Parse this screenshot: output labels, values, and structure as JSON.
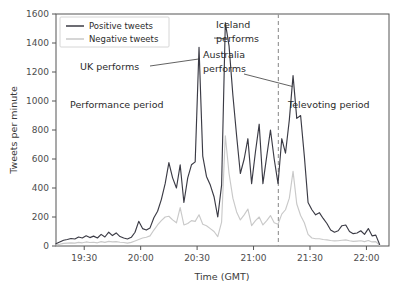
{
  "chart_data": {
    "type": "line",
    "title": "",
    "xlabel": "Time (GMT)",
    "ylabel": "Tweets per minute",
    "xlim": [
      19.25,
      22.2
    ],
    "ylim": [
      0,
      1600
    ],
    "grid": false,
    "legend_position": "upper left",
    "xtick_labels": [
      "19:30",
      "20:00",
      "20:30",
      "21:00",
      "21:30",
      "22:00"
    ],
    "xtick_values": [
      19.5,
      20.0,
      20.5,
      21.0,
      21.5,
      22.0
    ],
    "ytick_labels": [
      "0",
      "200",
      "400",
      "600",
      "800",
      "1000",
      "1200",
      "1400",
      "1600"
    ],
    "ytick_values": [
      0,
      200,
      400,
      600,
      800,
      1000,
      1200,
      1400,
      1600
    ],
    "series": [
      {
        "name": "Positive tweets",
        "color": "#3b3b45",
        "x": [
          19.25,
          19.283,
          19.317,
          19.35,
          19.383,
          19.417,
          19.45,
          19.483,
          19.517,
          19.55,
          19.583,
          19.617,
          19.65,
          19.683,
          19.717,
          19.75,
          19.783,
          19.817,
          19.85,
          19.883,
          19.917,
          19.95,
          19.983,
          20.017,
          20.05,
          20.083,
          20.117,
          20.15,
          20.183,
          20.217,
          20.25,
          20.283,
          20.317,
          20.35,
          20.383,
          20.417,
          20.45,
          20.483,
          20.517,
          20.55,
          20.583,
          20.617,
          20.65,
          20.683,
          20.717,
          20.75,
          20.783,
          20.817,
          20.85,
          20.883,
          20.917,
          20.95,
          20.983,
          21.017,
          21.05,
          21.083,
          21.117,
          21.15,
          21.183,
          21.217,
          21.25,
          21.283,
          21.317,
          21.35,
          21.383,
          21.417,
          21.45,
          21.483,
          21.517,
          21.55,
          21.583,
          21.617,
          21.65,
          21.683,
          21.717,
          21.75,
          21.783,
          21.817,
          21.85,
          21.883,
          21.917,
          21.95,
          21.983,
          22.017,
          22.05,
          22.083,
          22.117
        ],
        "values": [
          15,
          28,
          40,
          45,
          52,
          48,
          62,
          55,
          70,
          58,
          68,
          55,
          80,
          62,
          95,
          72,
          90,
          65,
          55,
          48,
          60,
          95,
          170,
          120,
          110,
          125,
          195,
          240,
          320,
          430,
          575,
          470,
          400,
          560,
          300,
          470,
          560,
          580,
          1370,
          620,
          480,
          420,
          340,
          200,
          420,
          1540,
          1380,
          1040,
          760,
          500,
          600,
          740,
          430,
          650,
          840,
          430,
          620,
          800,
          600,
          430,
          740,
          640,
          870,
          1175,
          880,
          900,
          620,
          300,
          250,
          215,
          230,
          190,
          155,
          110,
          95,
          105,
          140,
          145,
          100,
          85,
          90,
          105,
          80,
          120,
          70,
          75,
          10
        ]
      },
      {
        "name": "Negative tweets",
        "color": "#c9c9c9",
        "x": [
          19.25,
          19.283,
          19.317,
          19.35,
          19.383,
          19.417,
          19.45,
          19.483,
          19.517,
          19.55,
          19.583,
          19.617,
          19.65,
          19.683,
          19.717,
          19.75,
          19.783,
          19.817,
          19.85,
          19.883,
          19.917,
          19.95,
          19.983,
          20.017,
          20.05,
          20.083,
          20.117,
          20.15,
          20.183,
          20.217,
          20.25,
          20.283,
          20.317,
          20.35,
          20.383,
          20.417,
          20.45,
          20.483,
          20.517,
          20.55,
          20.583,
          20.617,
          20.65,
          20.683,
          20.717,
          20.75,
          20.783,
          20.817,
          20.85,
          20.883,
          20.917,
          20.95,
          20.983,
          21.017,
          21.05,
          21.083,
          21.117,
          21.15,
          21.183,
          21.217,
          21.25,
          21.283,
          21.317,
          21.35,
          21.383,
          21.417,
          21.45,
          21.483,
          21.517,
          21.55,
          21.583,
          21.617,
          21.65,
          21.683,
          21.717,
          21.75,
          21.783,
          21.817,
          21.85,
          21.883,
          21.917,
          21.95,
          21.983,
          22.017,
          22.05,
          22.083,
          22.117
        ],
        "values": [
          8,
          12,
          18,
          20,
          22,
          20,
          25,
          22,
          28,
          24,
          26,
          22,
          30,
          25,
          32,
          28,
          30,
          26,
          24,
          20,
          25,
          35,
          45,
          55,
          60,
          70,
          110,
          145,
          175,
          200,
          205,
          180,
          160,
          265,
          145,
          155,
          175,
          170,
          215,
          150,
          140,
          120,
          100,
          65,
          165,
          760,
          500,
          330,
          235,
          180,
          215,
          255,
          140,
          175,
          200,
          145,
          175,
          210,
          160,
          150,
          220,
          250,
          330,
          515,
          290,
          210,
          160,
          80,
          55,
          50,
          50,
          45,
          42,
          38,
          35,
          36,
          40,
          42,
          36,
          32,
          34,
          36,
          30,
          38,
          28,
          30,
          5
        ]
      }
    ],
    "annotations": [
      {
        "id": "uk",
        "text_line1": "UK performs",
        "text_line2": "",
        "target_x": 20.517,
        "target_y": 1290
      },
      {
        "id": "iceland",
        "text_line1": "Iceland",
        "text_line2": "performs",
        "target_x": 20.758,
        "target_y": 1430
      },
      {
        "id": "australia",
        "text_line1": "Australia",
        "text_line2": "performs",
        "target_x": 21.345,
        "target_y": 1100
      }
    ],
    "regions": [
      {
        "id": "performance",
        "label": "Performance period"
      },
      {
        "id": "televoting",
        "label": "Televoting period"
      }
    ],
    "divider": {
      "x": 21.22,
      "style": "dashed",
      "color": "#9a9a9a"
    }
  },
  "legend": {
    "entries": [
      {
        "label": "Positive tweets",
        "color": "#3b3b45"
      },
      {
        "label": "Negative tweets",
        "color": "#c9c9c9"
      }
    ]
  }
}
